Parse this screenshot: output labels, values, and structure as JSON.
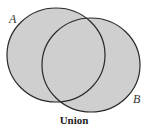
{
  "diagram": {
    "type": "venn",
    "sets": [
      {
        "label": "A",
        "shaded": true
      },
      {
        "label": "B",
        "shaded": true
      }
    ],
    "caption": "Union",
    "fill_color": "#cfcfcf",
    "stroke_color": "#2a2a2a"
  }
}
